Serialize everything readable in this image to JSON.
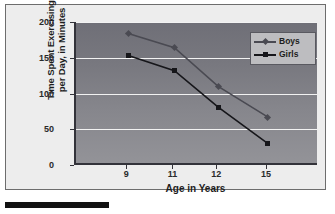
{
  "chart_data": {
    "type": "line",
    "title": "",
    "xlabel": "Age in Years",
    "ylabel_line1": "Time Spent Exercising",
    "ylabel_line2": "per Day, in Minutes",
    "categories": [
      "9",
      "11",
      "12",
      "15"
    ],
    "x_tick_labels": [
      "9",
      "11",
      "12",
      "15"
    ],
    "y_tick_labels": [
      "200",
      "150",
      "100",
      "50",
      "0"
    ],
    "ylim": [
      0,
      200
    ],
    "y_tick_values": [
      200,
      150,
      100,
      50,
      0
    ],
    "grid": "horizontal",
    "legend_position": "top-right",
    "series": [
      {
        "name": "Boys",
        "values": [
          184,
          164,
          110,
          67
        ],
        "color": "#4a4a52",
        "marker": "diamond"
      },
      {
        "name": "Girls",
        "values": [
          153,
          132,
          81,
          30
        ],
        "color": "#16161a",
        "marker": "square"
      }
    ]
  },
  "legend": {
    "entries": [
      {
        "label": "Boys"
      },
      {
        "label": "Girls"
      }
    ]
  },
  "colors": {
    "plot_background_top": "#6f6f77",
    "plot_background_bottom": "#939398",
    "figure_background": "#ededed",
    "gridline": "#f2f2f2",
    "axis": "#33333a",
    "boys_series": "#4a4a52",
    "girls_series": "#16161a",
    "legend_background": "#bdbdc0"
  }
}
